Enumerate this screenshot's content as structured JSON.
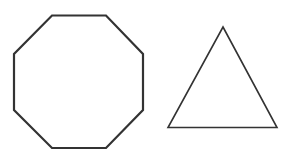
{
  "figure": {
    "width": 295,
    "height": 163,
    "background": "#ffffff",
    "stroke_color": "#333333",
    "shapes": [
      {
        "name": "octagon",
        "sides": 8,
        "points": "52,15.5 106,15.5 143,54 143,110 106,148 52,148 14,110 14,54",
        "stroke_width": 2.2
      },
      {
        "name": "triangle",
        "sides": 3,
        "points": "223,27 277,127.5 168,127.5",
        "stroke_width": 1.6
      }
    ]
  }
}
